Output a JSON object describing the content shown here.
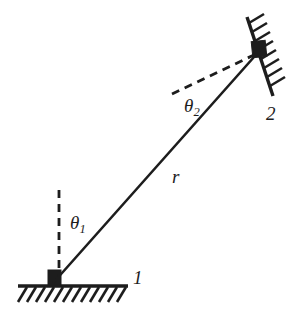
{
  "figure": {
    "background_color": "#ffffff",
    "ink_color": "#1d1d1d",
    "width": 308,
    "height": 325
  },
  "labels": {
    "theta1": {
      "symbol": "θ",
      "subscript": "1"
    },
    "theta2": {
      "symbol": "θ",
      "subscript": "2"
    },
    "rod_length": "r",
    "joint1": "1",
    "joint2": "2"
  },
  "geometry": {
    "lower_joint": {
      "x": 54,
      "y": 281
    },
    "upper_joint": {
      "x": 261,
      "y": 49
    },
    "ground_line": {
      "x1": 18,
      "y1": 286,
      "x2": 128,
      "y2": 286
    },
    "inclined_wall": {
      "x1": 247,
      "y1": 17,
      "x2": 273,
      "y2": 96
    },
    "rod": {
      "x1": 54,
      "y1": 282,
      "x2": 262,
      "y2": 48
    },
    "vertical_dashed": {
      "x1": 59,
      "y1": 190,
      "x2": 59,
      "y2": 277
    },
    "reference_dashed": {
      "x1": 172,
      "y1": 94,
      "x2": 256,
      "y2": 54
    },
    "hatch_count_ground": 12,
    "hatch_count_wall": 8
  }
}
